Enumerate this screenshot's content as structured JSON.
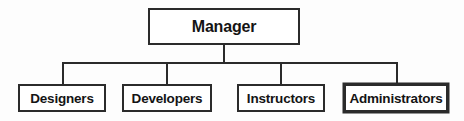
{
  "chart_data": {
    "type": "diagram",
    "diagram_kind": "organizational-chart",
    "title": "",
    "orientation": "top-down",
    "root": {
      "label": "Manager",
      "level": 0
    },
    "children": [
      {
        "label": "Designers",
        "level": 1,
        "emphasis": false
      },
      {
        "label": "Developers",
        "level": 1,
        "emphasis": false
      },
      {
        "label": "Instructors",
        "level": 1,
        "emphasis": false
      },
      {
        "label": "Administrators",
        "level": 1,
        "emphasis": true
      }
    ],
    "edges": [
      {
        "from": "Manager",
        "to": "Designers"
      },
      {
        "from": "Manager",
        "to": "Developers"
      },
      {
        "from": "Manager",
        "to": "Instructors"
      },
      {
        "from": "Manager",
        "to": "Administrators"
      }
    ],
    "colors": {
      "background": "#fdfdfd",
      "box_fill": "#ffffff",
      "box_border": "#2b2b2b",
      "connector": "#2b2b2b",
      "text": "#141414"
    }
  }
}
